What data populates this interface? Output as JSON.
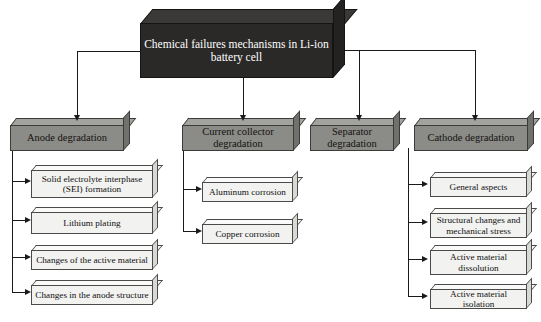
{
  "diagram": {
    "type": "hierarchical-flowchart",
    "root": {
      "label": "Chemical failures mechanisms in Li-ion battery cell",
      "fill_color": "#2a2927",
      "text_color": "#ffffff"
    },
    "branches": [
      {
        "label": "Anode degradation",
        "fill_color": "#8b8b87",
        "children": [
          {
            "label": "Solid electrolyte interphase (SEI) formation"
          },
          {
            "label": "Lithium plating"
          },
          {
            "label": "Changes of the active material"
          },
          {
            "label": "Changes in the anode structure"
          }
        ]
      },
      {
        "label": "Current collector degradation",
        "fill_color": "#8b8b87",
        "children": [
          {
            "label": "Aluminum corrosion"
          },
          {
            "label": "Copper corrosion"
          }
        ]
      },
      {
        "label": "Separator degradation",
        "fill_color": "#8b8b87",
        "children": []
      },
      {
        "label": "Cathode degradation",
        "fill_color": "#8b8b87",
        "children": [
          {
            "label": "General aspects"
          },
          {
            "label": "Structural changes and mechanical stress"
          },
          {
            "label": "Active material dissolution"
          },
          {
            "label": "Active material isolation"
          }
        ]
      }
    ]
  }
}
